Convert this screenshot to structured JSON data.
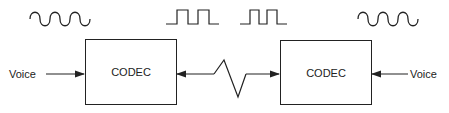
{
  "diagram": {
    "title": "",
    "colors": {
      "stroke": "#222222",
      "background": "#ffffff"
    },
    "nodes": [
      {
        "id": "codec-left",
        "label": "CODEC"
      },
      {
        "id": "codec-right",
        "label": "CODEC"
      }
    ],
    "inputs": {
      "left": {
        "label": "Voice"
      },
      "right": {
        "label": "Voice"
      }
    },
    "waveforms": [
      {
        "id": "analog-left",
        "type": "sine-wave",
        "position": "above left input"
      },
      {
        "id": "digital-left",
        "type": "square-wave",
        "position": "above link, left"
      },
      {
        "id": "digital-right",
        "type": "square-wave",
        "position": "above link, right"
      },
      {
        "id": "analog-right",
        "type": "sine-wave",
        "position": "above right input"
      }
    ],
    "edges": [
      {
        "from": "Voice (left)",
        "to": "codec-left",
        "style": "arrow"
      },
      {
        "from": "codec-left",
        "to": "codec-right",
        "style": "bidirectional arrow with zigzag (transmission link)"
      },
      {
        "from": "Voice (right)",
        "to": "codec-right",
        "style": "arrow"
      }
    ]
  }
}
